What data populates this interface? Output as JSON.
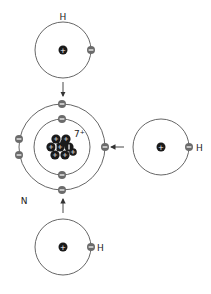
{
  "diagram": {
    "colors": {
      "orbit": "#555555",
      "nucleus": "#1a1a1a",
      "electron": "#6b6b6b",
      "sign": "#ffffff",
      "text": "#222222"
    },
    "nitrogen": {
      "label": "N",
      "nucleus_charge_label": "7",
      "nucleus_charge_sign": "+",
      "inner_shell_electrons": 2,
      "outer_shell_electrons": 5
    },
    "hydrogen_atoms": [
      {
        "id": "top",
        "label": "H"
      },
      {
        "id": "right",
        "label": "H"
      },
      {
        "id": "bottom",
        "label": "H"
      }
    ],
    "symbols": {
      "proton_sign": "+",
      "electron_sign": "−",
      "neutron_sign": "I"
    }
  }
}
